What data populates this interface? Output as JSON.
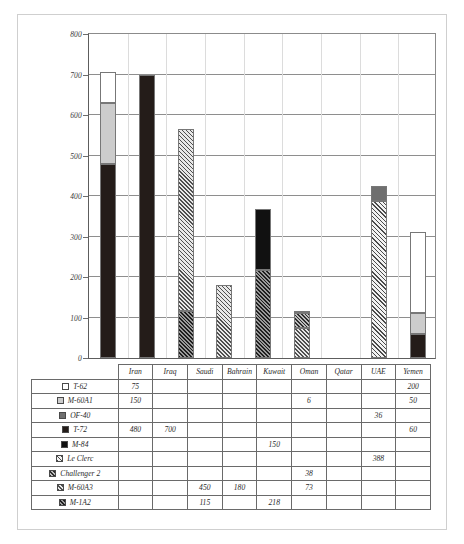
{
  "chart_data": {
    "type": "bar",
    "stacked": true,
    "title": "",
    "xlabel": "",
    "ylabel": "",
    "ylim": [
      0,
      800
    ],
    "ytick_step": 100,
    "yticks": [
      0,
      100,
      200,
      300,
      400,
      500,
      600,
      700,
      800
    ],
    "grid": true,
    "legend_position": "table-left-column",
    "categories": [
      "Iran",
      "Iraq",
      "Saudi",
      "Bahrain",
      "Kuwait",
      "Oman",
      "Qatar",
      "UAE",
      "Yemen"
    ],
    "series": [
      {
        "name": "T-62",
        "swatch": "white",
        "values": [
          75,
          null,
          null,
          null,
          null,
          null,
          null,
          null,
          200
        ]
      },
      {
        "name": "M-60A1",
        "swatch": "light-gray",
        "values": [
          150,
          null,
          null,
          null,
          null,
          6,
          null,
          null,
          50
        ]
      },
      {
        "name": "OF-40",
        "swatch": "medium-gray",
        "values": [
          null,
          null,
          null,
          null,
          null,
          null,
          null,
          36,
          null
        ]
      },
      {
        "name": "T-72",
        "swatch": "dark",
        "values": [
          480,
          700,
          null,
          null,
          null,
          null,
          null,
          null,
          60
        ]
      },
      {
        "name": "M-84",
        "swatch": "black",
        "values": [
          null,
          null,
          null,
          null,
          150,
          null,
          null,
          null,
          null
        ]
      },
      {
        "name": "Le Clerc",
        "swatch": "hatch-light",
        "values": [
          null,
          null,
          null,
          null,
          null,
          null,
          null,
          388,
          null
        ]
      },
      {
        "name": "Challenger 2",
        "swatch": "hatch-medium",
        "values": [
          null,
          null,
          null,
          null,
          null,
          38,
          null,
          null,
          null
        ]
      },
      {
        "name": "M-60A3",
        "swatch": "hatch-light2",
        "values": [
          null,
          null,
          450,
          180,
          null,
          73,
          null,
          null,
          null
        ]
      },
      {
        "name": "M-1A2",
        "swatch": "hatch-dark",
        "values": [
          null,
          null,
          115,
          null,
          218,
          null,
          null,
          null,
          null
        ]
      }
    ],
    "totals": [
      705,
      700,
      565,
      180,
      368,
      117,
      0,
      424,
      310
    ]
  },
  "table": {
    "corner_label": "",
    "column_headers": [
      "Iran",
      "Iraq",
      "Saudi",
      "Bahrain",
      "Kuwait",
      "Oman",
      "Qatar",
      "UAE",
      "Yemen"
    ],
    "rows": [
      {
        "label": "T-62",
        "cells": [
          "75",
          "",
          "",
          "",
          "",
          "",
          "",
          "",
          "200"
        ]
      },
      {
        "label": "M-60A1",
        "cells": [
          "150",
          "",
          "",
          "",
          "",
          "6",
          "",
          "",
          "50"
        ]
      },
      {
        "label": "OF-40",
        "cells": [
          "",
          "",
          "",
          "",
          "",
          "",
          "",
          "36",
          ""
        ]
      },
      {
        "label": "T-72",
        "cells": [
          "480",
          "700",
          "",
          "",
          "",
          "",
          "",
          "",
          "60"
        ]
      },
      {
        "label": "M-84",
        "cells": [
          "",
          "",
          "",
          "",
          "150",
          "",
          "",
          "",
          ""
        ]
      },
      {
        "label": "Le Clerc",
        "cells": [
          "",
          "",
          "",
          "",
          "",
          "",
          "",
          "388",
          ""
        ]
      },
      {
        "label": "Challenger 2",
        "cells": [
          "",
          "",
          "",
          "",
          "",
          "38",
          "",
          "",
          ""
        ]
      },
      {
        "label": "M-60A3",
        "cells": [
          "",
          "",
          "450",
          "180",
          "",
          "73",
          "",
          "",
          ""
        ]
      },
      {
        "label": "M-1A2",
        "cells": [
          "",
          "",
          "115",
          "",
          "218",
          "",
          "",
          "",
          ""
        ]
      }
    ]
  },
  "colors": {
    "t62": "#ffffff",
    "m60a1": "#cccccc",
    "of40": "#6f6f6f",
    "t72": "#241c19",
    "m84": "#111111",
    "leclerc": "#f2f2f2",
    "challenger2": "#bdbdbd",
    "m60a3": "#e8e8e8",
    "m1a2": "#9a9a9a",
    "grid": "#8e8e8e",
    "axis": "#5d5d5d",
    "frame": "#cfcfcf"
  }
}
